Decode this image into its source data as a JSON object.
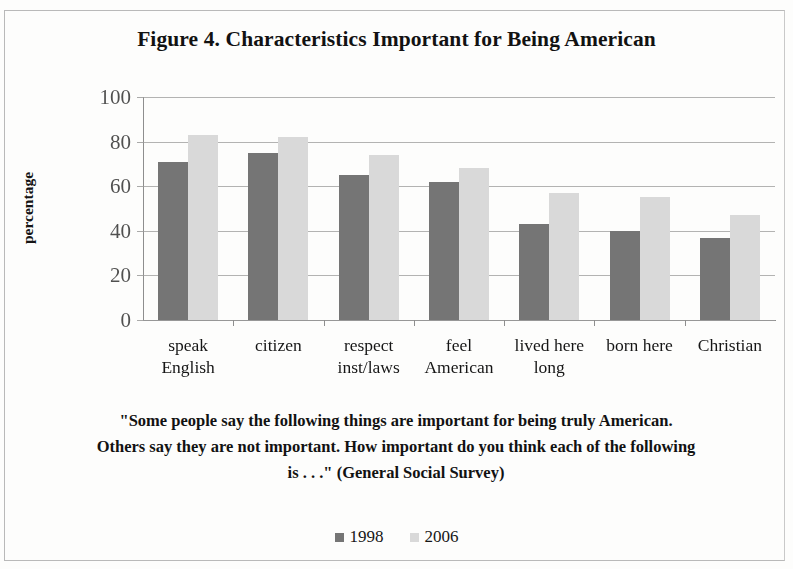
{
  "figure": {
    "title": "Figure 4. Characteristics Important for Being American",
    "caption": "\"Some people say the following things are important for being truly American. Others say they are not important. How important do you think each of the following is . . .\" (General Social Survey)"
  },
  "legend": {
    "items": [
      {
        "label": "1998",
        "color": "#757575",
        "swatch": "legend-swatch-1998"
      },
      {
        "label": "2006",
        "color": "#d9d9d9",
        "swatch": "legend-swatch-2006"
      }
    ]
  },
  "axis": {
    "y_title": "percentage",
    "y_ticks": [
      "100",
      "80",
      "60",
      "40",
      "20",
      "0"
    ]
  },
  "chart_data": {
    "type": "bar",
    "title": "Figure 4. Characteristics Important for Being American",
    "subtitle": "\"Some people say the following things are important for being truly American. Others say they are not important. How important do you think each of the following is . . .\" (General Social Survey)",
    "xlabel": "",
    "ylabel": "percentage",
    "ylim": [
      0,
      100
    ],
    "yticks": [
      0,
      20,
      40,
      60,
      80,
      100
    ],
    "grid": true,
    "legend_position": "bottom",
    "categories": [
      "speak English",
      "citizen",
      "respect inst/laws",
      "feel American",
      "lived here long",
      "born here",
      "Christian"
    ],
    "category_lines": [
      [
        "speak",
        "English"
      ],
      [
        "citizen",
        ""
      ],
      [
        "respect",
        "inst/laws"
      ],
      [
        "feel",
        "American"
      ],
      [
        "lived here",
        "long"
      ],
      [
        "born here",
        ""
      ],
      [
        "Christian",
        ""
      ]
    ],
    "series": [
      {
        "name": "1998",
        "color": "#757575",
        "values": [
          71,
          75,
          65,
          62,
          43,
          40,
          37
        ]
      },
      {
        "name": "2006",
        "color": "#d9d9d9",
        "values": [
          83,
          82,
          74,
          68,
          57,
          55,
          47
        ]
      }
    ]
  }
}
